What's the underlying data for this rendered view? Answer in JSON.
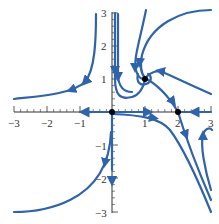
{
  "figure": {
    "type": "phase-portrait",
    "curve_color": "#2f63ab",
    "point_color": "#000000",
    "axes": {
      "x_ticks": [
        "−3",
        "−2",
        "−1",
        "1",
        "2",
        "3"
      ],
      "y_ticks": [
        "3",
        "2",
        "1",
        "−1",
        "−2",
        "−3"
      ],
      "xlim": [
        -3,
        3
      ],
      "ylim": [
        -3,
        3
      ]
    },
    "equilibria": [
      {
        "label": "origin",
        "x": 0,
        "y": 0,
        "kind": "saddle"
      },
      {
        "label": "spiral",
        "x": 1,
        "y": 1,
        "kind": "spiral-sink"
      },
      {
        "label": "saddle",
        "x": 2,
        "y": 0,
        "kind": "saddle"
      }
    ]
  }
}
